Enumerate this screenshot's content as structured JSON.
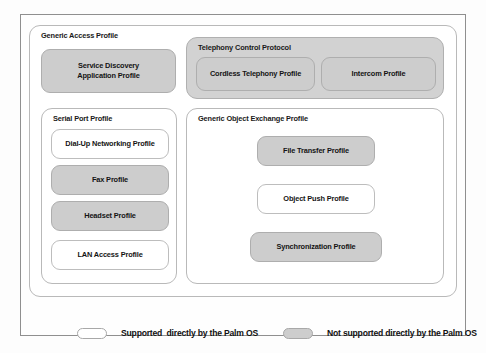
{
  "diagram": {
    "colors": {
      "supported_fill": "#ffffff",
      "unsupported_fill": "#cdcdcd",
      "border": "#b9b9b9",
      "frame": "#8f8f8f",
      "text": "#141414"
    },
    "groups": {
      "generic_access_profile": {
        "label": "Generic Access Profile"
      },
      "telephony_control_protocol": {
        "label": "Telephony Control Protocol"
      },
      "serial_port_profile": {
        "label": "Serial Port Profile"
      },
      "generic_object_exchange_profile": {
        "label": "Generic Object Exchange Profile"
      }
    },
    "profiles": {
      "service_discovery": {
        "line1": "Service Discovery",
        "line2": "Application Profile"
      },
      "cordless_telephony": {
        "label": "Cordless Telephony Profile"
      },
      "intercom": {
        "label": "Intercom Profile"
      },
      "dial_up_networking": {
        "label": "Dial-Up Networking Profile"
      },
      "fax": {
        "label": "Fax Profile"
      },
      "headset": {
        "label": "Headset Profile"
      },
      "lan_access": {
        "label": "LAN Access Profile"
      },
      "file_transfer": {
        "label": "File Transfer Profile"
      },
      "object_push": {
        "label": "Object Push Profile"
      },
      "synchronization": {
        "label": "Synchronization Profile"
      }
    },
    "legend": {
      "supported": {
        "label": "Supported  directly by the Palm OS"
      },
      "unsupported": {
        "label": "Not supported directly by the Palm OS"
      }
    }
  }
}
